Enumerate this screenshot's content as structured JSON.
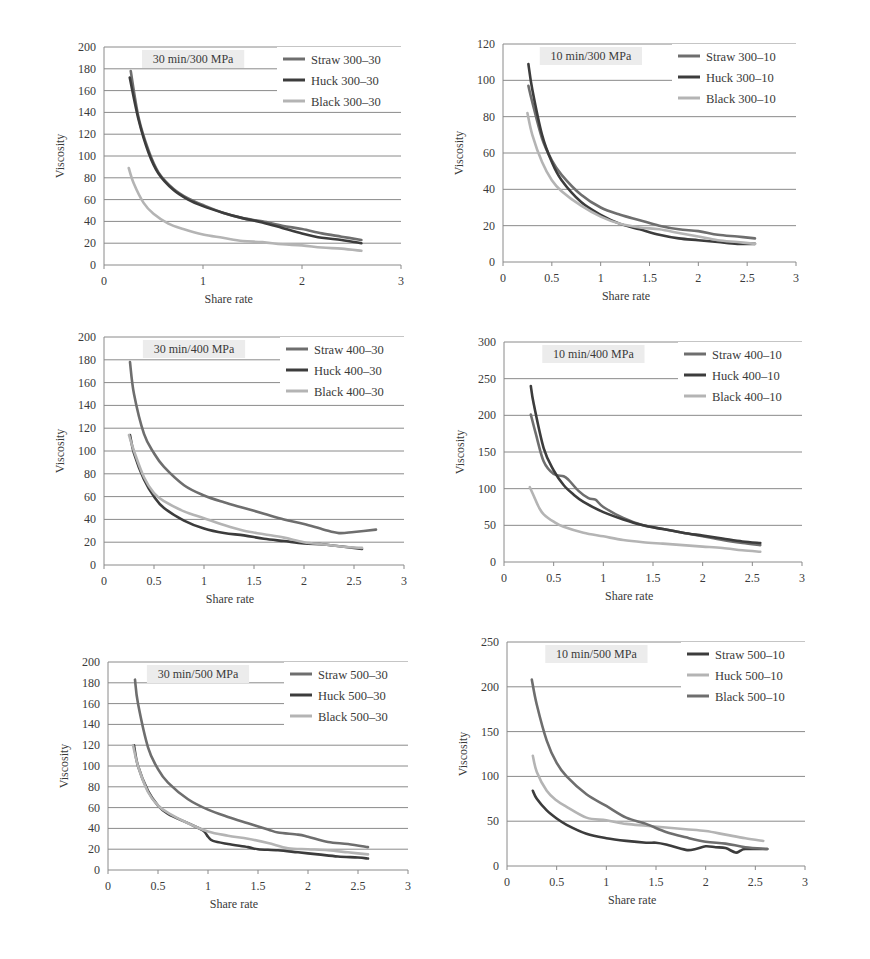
{
  "figure": {
    "panels_layout": "3 rows x 2 columns"
  },
  "colors": {
    "straw": "#6e6e6e",
    "huck": "#3c3c3c",
    "black": "#b4b4b4",
    "grid": "#8a8a8a",
    "title_bg": "#ececec"
  },
  "chart_data": [
    {
      "type": "line",
      "title": "30 min/300 MPa",
      "xlabel": "Share rate",
      "ylabel": "Viscosity",
      "xlim": [
        0,
        3
      ],
      "ylim": [
        0,
        200
      ],
      "xticks": [
        "0",
        "1",
        "2",
        "3"
      ],
      "xtick_values": [
        0,
        1,
        2,
        3
      ],
      "yticks": [
        "0",
        "20",
        "40",
        "60",
        "80",
        "100",
        "120",
        "140",
        "160",
        "180",
        "200"
      ],
      "ytick_values": [
        0,
        20,
        40,
        60,
        80,
        100,
        120,
        140,
        160,
        180,
        200
      ],
      "grid": true,
      "legend": "top-right",
      "series": [
        {
          "name": "Straw 300–30",
          "color_key": "straw",
          "x": [
            0.27,
            0.35,
            0.45,
            0.55,
            0.7,
            0.85,
            1.0,
            1.2,
            1.4,
            1.6,
            1.8,
            2.0,
            2.2,
            2.4,
            2.6
          ],
          "y": [
            178,
            135,
            105,
            85,
            70,
            61,
            55,
            48,
            43,
            40,
            36,
            33,
            29,
            26,
            23
          ]
        },
        {
          "name": "Huck 300–30",
          "color_key": "huck",
          "x": [
            0.26,
            0.35,
            0.45,
            0.55,
            0.7,
            0.85,
            1.0,
            1.2,
            1.4,
            1.6,
            1.8,
            2.0,
            2.2,
            2.4,
            2.6
          ],
          "y": [
            172,
            133,
            103,
            84,
            69,
            60,
            54,
            48,
            43,
            39,
            34,
            29,
            25,
            23,
            20
          ]
        },
        {
          "name": "Black 300–30",
          "color_key": "black",
          "x": [
            0.25,
            0.3,
            0.4,
            0.5,
            0.65,
            0.8,
            1.0,
            1.2,
            1.4,
            1.6,
            1.8,
            2.0,
            2.2,
            2.4,
            2.6
          ],
          "y": [
            89,
            75,
            57,
            47,
            38,
            33,
            28,
            25,
            22,
            21,
            19,
            18,
            16,
            15,
            13
          ]
        }
      ]
    },
    {
      "type": "line",
      "title": "10 min/300 MPa",
      "xlabel": "Share rate",
      "ylabel": "Viscosity",
      "xlim": [
        0,
        3
      ],
      "ylim": [
        0,
        120
      ],
      "xticks": [
        "0",
        "0.5",
        "1",
        "1.5",
        "2",
        "2.5",
        "3"
      ],
      "xtick_values": [
        0,
        0.5,
        1,
        1.5,
        2,
        2.5,
        3
      ],
      "yticks": [
        "0",
        "20",
        "40",
        "60",
        "80",
        "100",
        "120"
      ],
      "ytick_values": [
        0,
        20,
        40,
        60,
        80,
        100,
        120
      ],
      "grid": true,
      "legend": "top-right",
      "series": [
        {
          "name": "Straw 300–10",
          "color_key": "straw",
          "x": [
            0.26,
            0.3,
            0.4,
            0.5,
            0.6,
            0.8,
            1.0,
            1.2,
            1.4,
            1.6,
            1.8,
            2.0,
            2.2,
            2.4,
            2.58
          ],
          "y": [
            97,
            88,
            68,
            56,
            48,
            37,
            30,
            26,
            23,
            20,
            18,
            17,
            15,
            14,
            13
          ]
        },
        {
          "name": "Huck 300–10",
          "color_key": "huck",
          "x": [
            0.26,
            0.3,
            0.4,
            0.5,
            0.6,
            0.8,
            1.0,
            1.2,
            1.4,
            1.6,
            1.8,
            2.0,
            2.2,
            2.4,
            2.58
          ],
          "y": [
            109,
            95,
            70,
            55,
            45,
            33,
            26,
            21,
            18,
            15,
            13,
            12,
            11,
            10,
            10
          ]
        },
        {
          "name": "Black 300–10",
          "color_key": "black",
          "x": [
            0.25,
            0.3,
            0.4,
            0.5,
            0.6,
            0.8,
            1.0,
            1.2,
            1.4,
            1.6,
            1.8,
            2.0,
            2.2,
            2.4,
            2.58
          ],
          "y": [
            82,
            70,
            55,
            45,
            39,
            31,
            25,
            21,
            19,
            18,
            16,
            14,
            12,
            11,
            10
          ]
        }
      ]
    },
    {
      "type": "line",
      "title": "30 min/400 MPa",
      "xlabel": "Share rate",
      "ylabel": "Viscosity",
      "xlim": [
        0,
        3
      ],
      "ylim": [
        0,
        200
      ],
      "xticks": [
        "0",
        "0.5",
        "1",
        "1.5",
        "2",
        "2.5",
        "3"
      ],
      "xtick_values": [
        0,
        0.5,
        1,
        1.5,
        2,
        2.5,
        3
      ],
      "yticks": [
        "0",
        "20",
        "40",
        "60",
        "80",
        "100",
        "120",
        "140",
        "160",
        "180",
        "200"
      ],
      "ytick_values": [
        0,
        20,
        40,
        60,
        80,
        100,
        120,
        140,
        160,
        180,
        200
      ],
      "grid": true,
      "legend": "top-right",
      "series": [
        {
          "name": "Straw 400–30",
          "color_key": "straw",
          "x": [
            0.26,
            0.3,
            0.4,
            0.5,
            0.6,
            0.8,
            1.0,
            1.2,
            1.4,
            1.6,
            1.8,
            2.0,
            2.2,
            2.35,
            2.5,
            2.72
          ],
          "y": [
            178,
            150,
            115,
            98,
            86,
            70,
            61,
            55,
            50,
            45,
            40,
            36,
            31,
            28,
            29,
            31
          ]
        },
        {
          "name": "Huck 400–30",
          "color_key": "huck",
          "x": [
            0.26,
            0.3,
            0.4,
            0.5,
            0.6,
            0.8,
            1.0,
            1.2,
            1.4,
            1.6,
            1.8,
            2.0,
            2.2,
            2.4,
            2.58
          ],
          "y": [
            114,
            98,
            75,
            60,
            50,
            39,
            32,
            28,
            26,
            23,
            21,
            19,
            18,
            16,
            14
          ]
        },
        {
          "name": "Black 400–30",
          "color_key": "black",
          "x": [
            0.25,
            0.3,
            0.4,
            0.5,
            0.6,
            0.8,
            1.0,
            1.2,
            1.4,
            1.6,
            1.8,
            2.0,
            2.2,
            2.4,
            2.58
          ],
          "y": [
            114,
            100,
            77,
            63,
            56,
            47,
            41,
            35,
            30,
            27,
            24,
            20,
            18,
            16,
            15
          ]
        }
      ]
    },
    {
      "type": "line",
      "title": "10 min/400 MPa",
      "xlabel": "Share rate",
      "ylabel": "Viscosity",
      "xlim": [
        0,
        3
      ],
      "ylim": [
        0,
        300
      ],
      "xticks": [
        "0",
        "0.5",
        "1",
        "1.5",
        "2",
        "2.5",
        "3"
      ],
      "xtick_values": [
        0,
        0.5,
        1,
        1.5,
        2,
        2.5,
        3
      ],
      "yticks": [
        "0",
        "50",
        "100",
        "150",
        "200",
        "250",
        "300"
      ],
      "ytick_values": [
        0,
        50,
        100,
        150,
        200,
        250,
        300
      ],
      "grid": true,
      "legend": "top-right",
      "series": [
        {
          "name": "Straw 400–10",
          "color_key": "straw",
          "x": [
            0.27,
            0.32,
            0.4,
            0.5,
            0.6,
            0.65,
            0.75,
            0.85,
            0.92,
            1.0,
            1.2,
            1.4,
            1.6,
            1.8,
            2.0,
            2.2,
            2.4,
            2.58
          ],
          "y": [
            201,
            175,
            137,
            120,
            117,
            112,
            97,
            87,
            85,
            75,
            60,
            50,
            45,
            40,
            35,
            30,
            26,
            23
          ]
        },
        {
          "name": "Huck 400–10",
          "color_key": "huck",
          "x": [
            0.27,
            0.3,
            0.4,
            0.5,
            0.6,
            0.7,
            0.8,
            1.0,
            1.2,
            1.4,
            1.6,
            1.8,
            2.0,
            2.2,
            2.4,
            2.58
          ],
          "y": [
            240,
            215,
            155,
            125,
            105,
            92,
            82,
            68,
            58,
            50,
            45,
            40,
            36,
            32,
            28,
            26
          ]
        },
        {
          "name": "Black 400–10",
          "color_key": "black",
          "x": [
            0.26,
            0.3,
            0.35,
            0.4,
            0.5,
            0.6,
            0.8,
            1.0,
            1.2,
            1.4,
            1.6,
            1.8,
            2.0,
            2.2,
            2.4,
            2.58
          ],
          "y": [
            102,
            90,
            75,
            65,
            55,
            48,
            40,
            35,
            30,
            27,
            25,
            23,
            21,
            19,
            16,
            14
          ]
        }
      ]
    },
    {
      "type": "line",
      "title": "30 min/500 MPa",
      "xlabel": "Share rate",
      "ylabel": "Viscosity",
      "xlim": [
        0,
        3
      ],
      "ylim": [
        0,
        200
      ],
      "xticks": [
        "0",
        "0.5",
        "1",
        "1.5",
        "2",
        "2.5",
        "3"
      ],
      "xtick_values": [
        0,
        0.5,
        1,
        1.5,
        2,
        2.5,
        3
      ],
      "yticks": [
        "0",
        "20",
        "40",
        "60",
        "80",
        "100",
        "120",
        "140",
        "160",
        "180",
        "200"
      ],
      "ytick_values": [
        0,
        20,
        40,
        60,
        80,
        100,
        120,
        140,
        160,
        180,
        200
      ],
      "grid": true,
      "legend": "top-right",
      "series": [
        {
          "name": "Straw 500–30",
          "color_key": "straw",
          "x": [
            0.27,
            0.3,
            0.4,
            0.5,
            0.6,
            0.8,
            1.0,
            1.2,
            1.4,
            1.6,
            1.7,
            1.9,
            2.0,
            2.2,
            2.4,
            2.6
          ],
          "y": [
            183,
            160,
            118,
            97,
            84,
            68,
            58,
            51,
            45,
            39,
            36,
            34,
            32,
            27,
            25,
            22
          ]
        },
        {
          "name": "Huck 500–30",
          "color_key": "huck",
          "x": [
            0.26,
            0.3,
            0.4,
            0.5,
            0.6,
            0.8,
            0.95,
            1.0,
            1.05,
            1.2,
            1.4,
            1.5,
            1.7,
            1.9,
            2.1,
            2.3,
            2.5,
            2.6
          ],
          "y": [
            120,
            100,
            76,
            62,
            54,
            45,
            38,
            32,
            28,
            25,
            22,
            20,
            19,
            17,
            15,
            13,
            12,
            11
          ]
        },
        {
          "name": "Black 500–30",
          "color_key": "black",
          "x": [
            0.25,
            0.3,
            0.4,
            0.5,
            0.6,
            0.8,
            1.0,
            1.2,
            1.4,
            1.6,
            1.8,
            2.0,
            2.2,
            2.4,
            2.6
          ],
          "y": [
            120,
            100,
            75,
            62,
            55,
            45,
            37,
            33,
            30,
            26,
            21,
            20,
            19,
            17,
            15
          ]
        }
      ]
    },
    {
      "type": "line",
      "title": "10 min/500 MPa",
      "xlabel": "Share rate",
      "ylabel": "Viscosity",
      "xlim": [
        0,
        3
      ],
      "ylim": [
        0,
        250
      ],
      "xticks": [
        "0",
        "0.5",
        "1",
        "1.5",
        "2",
        "2.5",
        "3"
      ],
      "xtick_values": [
        0,
        0.5,
        1,
        1.5,
        2,
        2.5,
        3
      ],
      "yticks": [
        "0",
        "50",
        "100",
        "150",
        "200",
        "250"
      ],
      "ytick_values": [
        0,
        50,
        100,
        150,
        200,
        250
      ],
      "grid": true,
      "legend": "top-right",
      "series": [
        {
          "name": "Straw 500–10",
          "color_key": "huck",
          "x": [
            0.26,
            0.3,
            0.4,
            0.5,
            0.6,
            0.8,
            1.0,
            1.2,
            1.4,
            1.5,
            1.6,
            1.8,
            1.9,
            2.0,
            2.1,
            2.2,
            2.3,
            2.35,
            2.4,
            2.62
          ],
          "y": [
            84,
            75,
            62,
            53,
            46,
            36,
            31,
            28,
            26,
            26,
            24,
            18,
            19,
            22,
            21,
            20,
            15,
            17,
            19,
            19
          ]
        },
        {
          "name": "Huck 500–10",
          "color_key": "black",
          "x": [
            0.26,
            0.3,
            0.4,
            0.5,
            0.6,
            0.8,
            1.0,
            1.2,
            1.4,
            1.6,
            1.8,
            2.0,
            2.2,
            2.4,
            2.58
          ],
          "y": [
            123,
            105,
            84,
            73,
            66,
            54,
            51,
            47,
            45,
            43,
            41,
            39,
            35,
            31,
            28
          ]
        },
        {
          "name": "Black 500–10",
          "color_key": "straw",
          "x": [
            0.25,
            0.3,
            0.4,
            0.5,
            0.6,
            0.8,
            1.0,
            1.2,
            1.4,
            1.6,
            1.8,
            2.0,
            2.2,
            2.4,
            2.62
          ],
          "y": [
            208,
            180,
            140,
            115,
            100,
            80,
            67,
            54,
            47,
            38,
            32,
            27,
            25,
            21,
            19
          ]
        }
      ]
    }
  ]
}
